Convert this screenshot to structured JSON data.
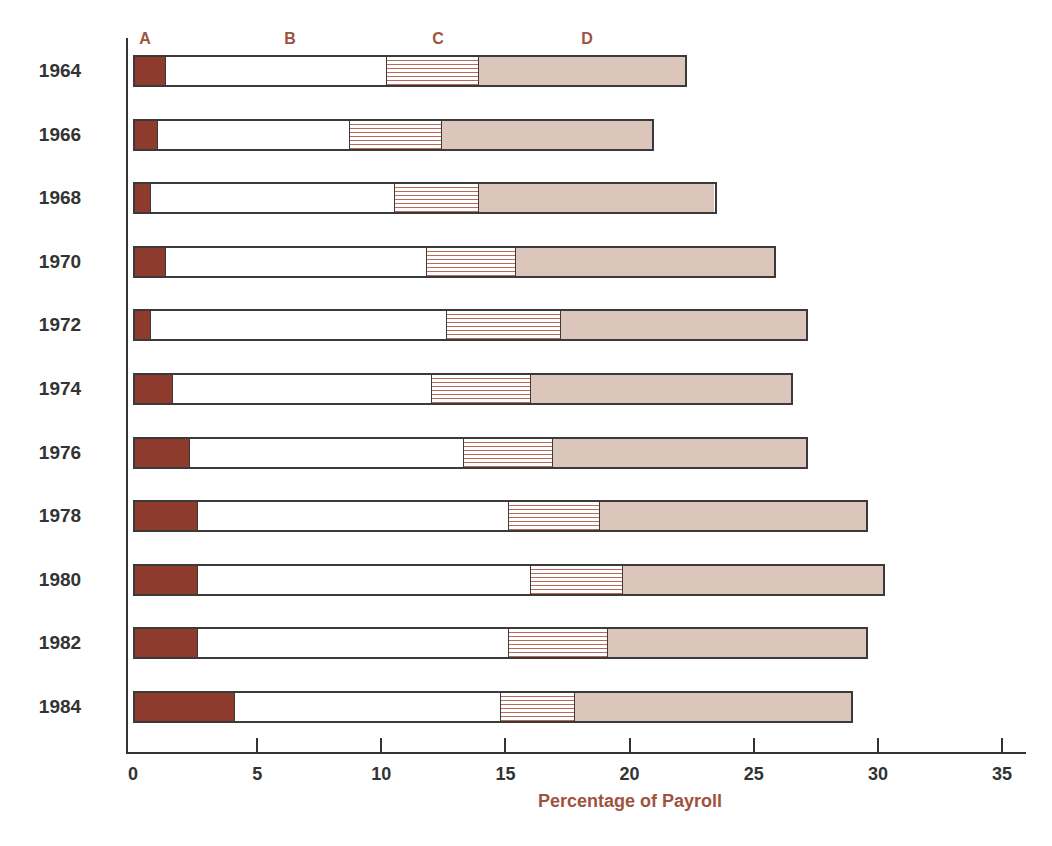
{
  "chart_data": {
    "type": "bar",
    "orientation": "horizontal",
    "stacked": true,
    "title": "",
    "xlabel": "Percentage of Payroll",
    "ylabel": "",
    "xlim": [
      0,
      35
    ],
    "xticks": [
      0,
      5,
      10,
      15,
      20,
      25,
      30,
      35
    ],
    "grid": false,
    "legend": "segment letters A, B, C, D above first bar",
    "categories": [
      "1964",
      "1966",
      "1968",
      "1970",
      "1972",
      "1974",
      "1976",
      "1978",
      "1980",
      "1982",
      "1984"
    ],
    "series": [
      {
        "name": "A",
        "color": "#8e3b2d",
        "pattern": "solid dark",
        "values": [
          1.2,
          0.9,
          0.6,
          1.2,
          0.6,
          1.5,
          2.2,
          2.5,
          2.5,
          2.5,
          4.0
        ]
      },
      {
        "name": "B",
        "color": "#ffffff",
        "pattern": "white",
        "values": [
          9.0,
          7.8,
          9.9,
          10.6,
          12.0,
          10.5,
          11.1,
          12.6,
          13.5,
          12.6,
          10.8
        ]
      },
      {
        "name": "C",
        "color": "#b86a5a",
        "pattern": "horizontal stripes",
        "values": [
          3.7,
          3.7,
          3.4,
          3.6,
          4.6,
          4.0,
          3.6,
          3.7,
          3.7,
          4.0,
          3.0
        ]
      },
      {
        "name": "D",
        "color": "#dcc6bc",
        "pattern": "light stipple",
        "values": [
          8.4,
          8.6,
          9.6,
          10.5,
          10.0,
          10.6,
          10.3,
          10.8,
          10.6,
          10.5,
          11.2
        ]
      }
    ],
    "totals": [
      22.3,
      21.0,
      23.5,
      25.9,
      27.2,
      26.6,
      27.2,
      29.6,
      30.3,
      29.6,
      29.0
    ]
  },
  "labels": {
    "segment_letters": [
      "A",
      "B",
      "C",
      "D"
    ],
    "x_title": "Percentage of Payroll",
    "tick_labels": [
      "0",
      "5",
      "10",
      "15",
      "20",
      "25",
      "30",
      "35"
    ]
  }
}
